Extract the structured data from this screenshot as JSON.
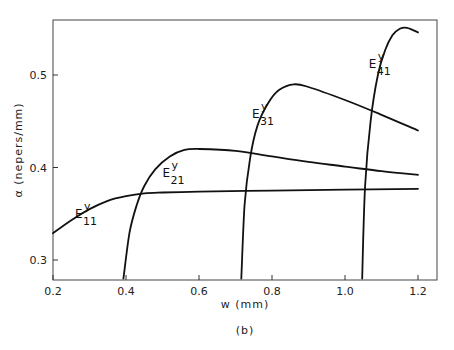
{
  "chart_data": {
    "type": "line",
    "title": "",
    "caption": "(b)",
    "xlabel": "w (mm)",
    "ylabel": "α (nepers/mm)",
    "xlim": [
      0.2,
      1.25
    ],
    "ylim": [
      0.28,
      0.56
    ],
    "grid": false,
    "legend": "inline labels",
    "xticks": [
      0.2,
      0.4,
      0.6,
      0.8,
      1.0,
      1.2
    ],
    "xtick_labels": [
      "0.2",
      "0.4",
      "0.6",
      "0.8",
      "1.0",
      "1.2"
    ],
    "yticks": [
      0.3,
      0.4,
      0.5
    ],
    "ytick_labels": [
      "0.3",
      "0.4",
      "0.5"
    ],
    "series": [
      {
        "name": "E11y",
        "label_main": "E",
        "label_sup": "y",
        "label_sub": "11",
        "label_pos": [
          0.26,
          0.345
        ],
        "x": [
          0.2,
          0.25,
          0.3,
          0.35,
          0.4,
          0.45,
          0.5,
          0.6,
          0.8,
          1.0,
          1.2
        ],
        "y": [
          0.329,
          0.343,
          0.355,
          0.364,
          0.369,
          0.372,
          0.373,
          0.374,
          0.375,
          0.376,
          0.377
        ]
      },
      {
        "name": "E21y",
        "label_main": "E",
        "label_sup": "y",
        "label_sub": "21",
        "label_pos": [
          0.5,
          0.39
        ],
        "x": [
          0.393,
          0.41,
          0.43,
          0.45,
          0.48,
          0.52,
          0.56,
          0.6,
          0.7,
          0.8,
          0.9,
          1.0,
          1.1,
          1.2
        ],
        "y": [
          0.28,
          0.33,
          0.36,
          0.38,
          0.398,
          0.412,
          0.419,
          0.42,
          0.418,
          0.412,
          0.406,
          0.401,
          0.396,
          0.392
        ]
      },
      {
        "name": "E31y",
        "label_main": "E",
        "label_sup": "y",
        "label_sub": "31",
        "label_pos": [
          0.745,
          0.453
        ],
        "x": [
          0.716,
          0.725,
          0.74,
          0.76,
          0.79,
          0.82,
          0.86,
          0.9,
          1.0,
          1.1,
          1.2
        ],
        "y": [
          0.28,
          0.36,
          0.41,
          0.445,
          0.47,
          0.484,
          0.49,
          0.487,
          0.473,
          0.457,
          0.44
        ]
      },
      {
        "name": "E41y",
        "label_main": "E",
        "label_sup": "y",
        "label_sub": "41",
        "label_pos": [
          1.065,
          0.508
        ],
        "x": [
          1.047,
          1.055,
          1.07,
          1.09,
          1.11,
          1.13,
          1.15,
          1.17,
          1.2
        ],
        "y": [
          0.28,
          0.38,
          0.45,
          0.5,
          0.527,
          0.543,
          0.55,
          0.551,
          0.546
        ]
      }
    ]
  }
}
